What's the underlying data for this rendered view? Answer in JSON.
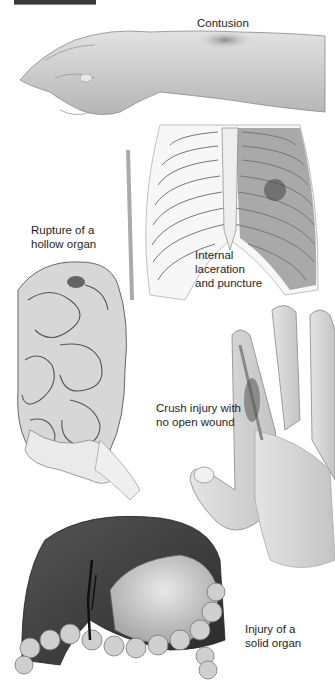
{
  "figure": {
    "title_bar": "",
    "colors": {
      "skin": "#d9d9d9",
      "skin_shadow": "#a8a8a8",
      "bone": "#eeeeee",
      "bone_outline": "#777777",
      "lung": "#8c8c8c",
      "liver": "#3e3e3e",
      "stomach": "#c9c9c9",
      "bruise": "#333333"
    },
    "labels": {
      "contusion": "Contusion",
      "internal_laceration": "Internal\nlaceration\nand puncture",
      "rupture_hollow": "Rupture of a\nhollow organ",
      "crush_injury": "Crush injury with\nno open wound",
      "solid_organ": "Injury of a\nsolid organ"
    }
  }
}
